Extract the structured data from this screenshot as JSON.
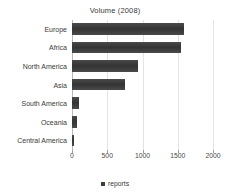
{
  "chart_data": {
    "type": "bar",
    "orientation": "horizontal",
    "title": "Volume (2008)",
    "xlabel": "",
    "ylabel": "",
    "categories": [
      "Europe",
      "Africa",
      "North America",
      "Asia",
      "South America",
      "Oceania",
      "Central America"
    ],
    "series": [
      {
        "name": "reports",
        "values": [
          1590,
          1550,
          930,
          750,
          100,
          70,
          25
        ],
        "color": "#3d3d3d"
      }
    ],
    "xlim": [
      0,
      2000
    ],
    "xticks": [
      0,
      500,
      1000,
      1500,
      2000
    ],
    "xtick_labels": [
      "0",
      "500",
      "1000",
      "1500",
      "2000"
    ],
    "grid": true,
    "grid_axis": "x",
    "grid_color": "#dedede",
    "legend": {
      "position": "bottom",
      "entries": [
        {
          "label": "reports",
          "color": "#3d3d3d"
        }
      ]
    },
    "background": "#ffffff"
  }
}
